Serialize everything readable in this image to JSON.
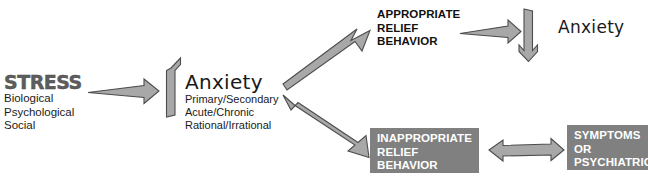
{
  "diagram": {
    "palette": {
      "arrow_fill": "#a8a8a8",
      "arrow_outline": "#4d4d4d",
      "box_fill": "#808080",
      "box_text": "#ffffff",
      "body_text": "#1a1a1a",
      "background": "#ffffff"
    },
    "nodes": {
      "stress": {
        "title": "STRESS",
        "items": [
          "Biological",
          "Psychological",
          "Social"
        ]
      },
      "anxiety_main": {
        "title": "Anxiety",
        "items": [
          "Primary/Secondary",
          "Acute/Chronic",
          "Rational/Irrational"
        ]
      },
      "appropriate_relief": {
        "lines": [
          "APPROPRIATE",
          "RELIEF",
          "BEHAVIOR"
        ]
      },
      "anxiety_reduced": {
        "title": "Anxiety"
      },
      "inappropriate_relief": {
        "lines": [
          "INAPPROPRIATE",
          "RELIEF",
          "BEHAVIOR"
        ]
      },
      "symptoms": {
        "lines": [
          "SYMPTOMS OR",
          "PSYCHIATRIC",
          "SYNDROMES"
        ]
      }
    },
    "arrows": [
      {
        "id": "stress-to-anxiety",
        "direction": "right",
        "heads": 1,
        "label": ""
      },
      {
        "id": "anxiety-increase",
        "direction": "up",
        "heads": 1,
        "label": ""
      },
      {
        "id": "anxiety-to-appropriate",
        "direction": "up-right",
        "heads": 1,
        "label": ""
      },
      {
        "id": "anxiety-to-inappropriate",
        "direction": "down-right",
        "heads": 2,
        "label": ""
      },
      {
        "id": "appropriate-to-anxiety-drop",
        "direction": "right",
        "heads": 1,
        "label": ""
      },
      {
        "id": "anxiety-decrease",
        "direction": "down",
        "heads": 1,
        "label": ""
      },
      {
        "id": "inappropriate-to-symptoms",
        "direction": "horizontal",
        "heads": 2,
        "label": ""
      }
    ]
  }
}
